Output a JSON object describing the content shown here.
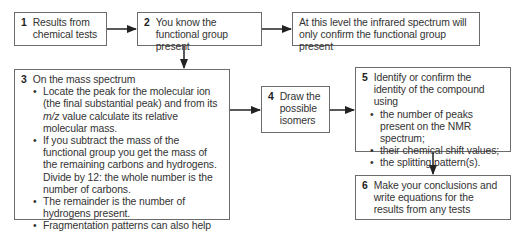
{
  "boxes": {
    "b1": {
      "number": "1",
      "text": "Results from chemical tests"
    },
    "b2": {
      "number": "2",
      "text": "You know the functional group present"
    },
    "b_ir": {
      "text": "At this level the infrared spectrum will only confirm the functional group present"
    },
    "b3": {
      "number": "3",
      "heading": "On the mass spectrum",
      "bullets": [
        {
          "pre": "Locate the peak for the molecular ion (the final substantial peak) and from its ",
          "italic": "m/z",
          "post": " value calculate its relative molecular mass."
        },
        {
          "text": "If you subtract the mass of the functional group you get the mass of the remaining carbons and hydrogens. Divide by 12: the whole number is the number of carbons."
        },
        {
          "text": "The remainder is the number of hydrogens present."
        },
        {
          "text": "Fragmentation patterns can also help identification."
        }
      ]
    },
    "b4": {
      "number": "4",
      "text": "Draw the possible isomers"
    },
    "b5": {
      "number": "5",
      "heading": "Identify or confirm the identity of the compound using",
      "bullets": [
        "the number of peaks present on the NMR spectrum;",
        "their chemical shift values;",
        "the splitting pattern(s)."
      ]
    },
    "b6": {
      "number": "6",
      "text": "Make your conclusions and write equations for the results from any tests"
    }
  },
  "colors": {
    "border": "#6b6b6b",
    "arrow": "#222222",
    "text": "#333333"
  }
}
